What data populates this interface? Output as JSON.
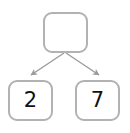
{
  "diagram": {
    "type": "binary-tree",
    "title": "",
    "background_color": "#ffffff",
    "node_border_color": "#b2b2b2",
    "node_fill_color": "#ffffff",
    "edge_color": "#9a9a9a",
    "text_color": "#111111",
    "nodes": [
      {
        "id": "root",
        "label": "",
        "role": "root-node"
      },
      {
        "id": "left",
        "label": "2",
        "role": "leaf-node"
      },
      {
        "id": "right",
        "label": "7",
        "role": "leaf-node"
      }
    ],
    "edges": [
      {
        "from": "root",
        "to": "left",
        "arrow": true
      },
      {
        "from": "root",
        "to": "right",
        "arrow": true
      }
    ]
  }
}
